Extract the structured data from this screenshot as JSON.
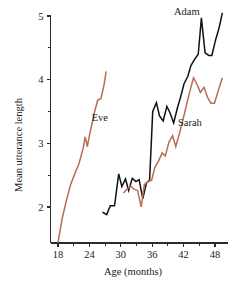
{
  "chart_data": {
    "type": "line",
    "title": "",
    "xlabel": "Age (months)",
    "ylabel": "Mean utterance length",
    "xlim": [
      16,
      50.5
    ],
    "ylim": [
      1.35,
      5.15
    ],
    "xticks": [
      18,
      24,
      30,
      36,
      42,
      48
    ],
    "xtick_labels": [
      "18",
      "24",
      "30",
      "36",
      "42",
      "48"
    ],
    "x_minor_ticks": [
      21,
      27,
      33,
      39,
      45
    ],
    "yticks": [
      2,
      3,
      4,
      5
    ],
    "ytick_labels": [
      "2",
      "3",
      "4",
      "5"
    ],
    "y_minor_ticks": [
      2.5,
      3.5,
      4.5
    ],
    "grid": false,
    "legend": "inline-labels",
    "series": [
      {
        "name": "Eve",
        "color": "#b5704f",
        "label_x": 26.0,
        "label_y": 3.35,
        "x": [
          18.0,
          18.8,
          19.6,
          20.4,
          21.2,
          22.0,
          22.8,
          23.2,
          23.6,
          24.2,
          25.0,
          25.6,
          26.2,
          26.8,
          27.2
        ],
        "y": [
          1.44,
          1.82,
          2.1,
          2.35,
          2.52,
          2.68,
          2.92,
          3.1,
          2.95,
          3.2,
          3.5,
          3.68,
          3.7,
          3.92,
          4.13
        ]
      },
      {
        "name": "Adam",
        "color": "#111111",
        "label_x": 42.6,
        "label_y": 5.02,
        "x": [
          26.5,
          27.3,
          28.0,
          28.8,
          29.6,
          30.2,
          30.9,
          31.5,
          32.2,
          32.9,
          33.5,
          34.2,
          34.9,
          35.5,
          36.1,
          36.8,
          37.4,
          38.1,
          38.8,
          39.4,
          40.1,
          40.8,
          41.4,
          42.1,
          42.8,
          43.4,
          44.1,
          44.8,
          45.4,
          46.1,
          46.8,
          47.4,
          48.1,
          48.8,
          49.4
        ],
        "y": [
          1.92,
          1.88,
          2.02,
          2.02,
          2.52,
          2.32,
          2.44,
          2.26,
          2.45,
          2.4,
          2.43,
          2.13,
          2.38,
          2.42,
          3.5,
          3.64,
          3.43,
          3.35,
          3.58,
          3.48,
          3.32,
          3.55,
          3.72,
          3.94,
          4.05,
          4.22,
          4.32,
          4.4,
          4.97,
          4.42,
          4.38,
          4.38,
          4.62,
          4.82,
          5.05
        ]
      },
      {
        "name": "Sarah",
        "color": "#b5704f",
        "label_x": 43.2,
        "label_y": 3.28,
        "x": [
          30.5,
          31.2,
          31.9,
          32.5,
          33.2,
          33.9,
          34.5,
          35.2,
          35.9,
          36.5,
          37.2,
          37.9,
          38.5,
          39.2,
          39.9,
          40.5,
          41.2,
          41.9,
          42.6,
          43.2,
          43.9,
          44.6,
          45.2,
          45.9,
          46.6,
          47.2,
          47.9,
          48.6,
          49.4
        ],
        "y": [
          2.22,
          2.28,
          2.33,
          2.28,
          2.26,
          2.0,
          2.35,
          2.4,
          2.42,
          2.62,
          2.72,
          2.85,
          2.8,
          3.02,
          3.12,
          2.95,
          3.15,
          3.38,
          3.62,
          3.82,
          4.03,
          3.92,
          3.8,
          3.88,
          3.72,
          3.63,
          3.63,
          3.82,
          4.03
        ]
      }
    ]
  },
  "axis": {
    "x_title": "Age (months)",
    "y_title": "Mean utterance length"
  },
  "labels": {
    "adam": "Adam",
    "eve": "Eve",
    "sarah": "Sarah"
  }
}
